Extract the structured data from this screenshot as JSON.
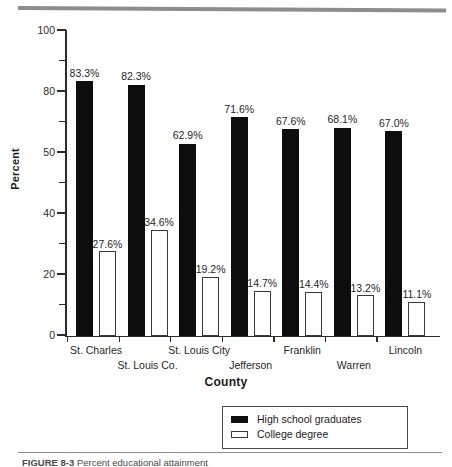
{
  "figure": {
    "caption_label": "FIGURE 8-3",
    "caption_text": "Percent educational attainment"
  },
  "chart_data": {
    "type": "bar",
    "title": "",
    "xlabel": "County",
    "ylabel": "Percent",
    "ylim": [
      0,
      100
    ],
    "yticks": [
      0,
      10,
      20,
      30,
      40,
      50,
      60,
      70,
      80,
      90,
      100
    ],
    "ytick_labels": [
      "0",
      "",
      "20",
      "",
      "40",
      "",
      "50",
      "",
      "80",
      "",
      "100"
    ],
    "ytick_labeled_values": [
      0,
      20,
      40,
      60,
      80,
      100
    ],
    "ytick_labeled_text": [
      "0",
      "20",
      "40",
      "50",
      "80",
      "100"
    ],
    "grid": false,
    "legend_position": "bottom-right",
    "categories": [
      "St. Charles",
      "St. Louis Co.",
      "St. Louis City",
      "Jefferson",
      "Franklin",
      "Warren",
      "Lincoln"
    ],
    "series": [
      {
        "name": "High school graduates",
        "color": "#0d0d0d",
        "values": [
          83.3,
          82.3,
          62.9,
          71.6,
          67.6,
          68.1,
          67.0
        ],
        "labels": [
          "83.3%",
          "82.3%",
          "62.9%",
          "71.6%",
          "67.6%",
          "68.1%",
          "67.0%"
        ]
      },
      {
        "name": "College degree",
        "color": "#ffffff",
        "values": [
          27.6,
          34.6,
          19.2,
          14.7,
          14.4,
          13.2,
          11.1
        ],
        "labels": [
          "27.6%",
          "34.6%",
          "19.2%",
          "14.7%",
          "14.4%",
          "13.2%",
          "11.1%"
        ]
      }
    ]
  },
  "legend": {
    "items": [
      {
        "label": "High school graduates",
        "swatch": "filled"
      },
      {
        "label": "College degree",
        "swatch": "hollow"
      }
    ]
  },
  "colors": {
    "bar_filled": "#0d0d0d",
    "bar_hollow_border": "#3a3a3a",
    "axis": "#2b2b2b",
    "rule": "#8d8d8d"
  }
}
